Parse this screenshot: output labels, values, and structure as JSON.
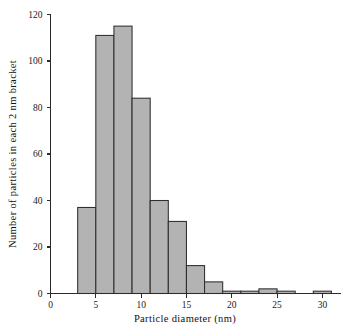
{
  "chart_data": {
    "type": "bar",
    "title": "",
    "subtitle": "",
    "xlabel": "Particle diameter (nm)",
    "ylabel": "Number of particles in each 2 nm bracket",
    "xlim": [
      0,
      32
    ],
    "ylim": [
      0,
      120
    ],
    "grid": false,
    "legend": null,
    "bin_width": 2,
    "bar_fill_color": "#b3b3b3",
    "bar_edge_color": "#2e2e2e",
    "axis_color": "#2b2b2b",
    "xticks": [
      0,
      5,
      10,
      15,
      20,
      25,
      30
    ],
    "xtick_labels": [
      "0",
      "5",
      "10",
      "15",
      "20",
      "25",
      "30"
    ],
    "yticks": [
      0,
      20,
      40,
      60,
      80,
      100,
      120
    ],
    "ytick_labels": [
      "0",
      "20",
      "40",
      "60",
      "80",
      "100",
      "120"
    ],
    "categories": [
      "3-5",
      "5-7",
      "7-9",
      "9-11",
      "11-13",
      "13-15",
      "15-17",
      "17-19",
      "19-21",
      "21-23",
      "23-25",
      "25-27",
      "29-31"
    ],
    "bin_starts": [
      3,
      5,
      7,
      9,
      11,
      13,
      15,
      17,
      19,
      21,
      23,
      25,
      29
    ],
    "bin_ends": [
      5,
      7,
      9,
      11,
      13,
      15,
      17,
      19,
      21,
      23,
      25,
      27,
      31
    ],
    "values": [
      37,
      111,
      115,
      84,
      40,
      31,
      12,
      5,
      1,
      1,
      2,
      1,
      1
    ],
    "x": [
      4,
      6,
      8,
      10,
      12,
      14,
      16,
      18,
      20,
      22,
      24,
      26,
      30
    ]
  },
  "labels": {
    "x_axis_title": "Particle diameter (nm)",
    "y_axis_title": "Number of particles in each 2 nm bracket"
  }
}
